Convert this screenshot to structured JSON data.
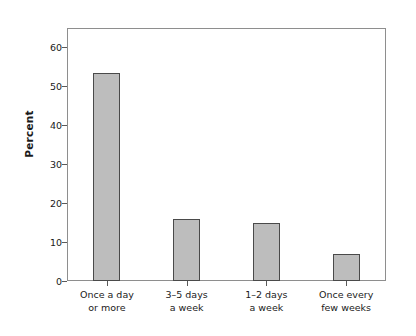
{
  "chart_data": {
    "type": "bar",
    "title": "",
    "subtitle": "",
    "xlabel": "",
    "ylabel": "Percent",
    "categories": [
      "Once a day\nor more",
      "3–5 days\na week",
      "1–2 days\na week",
      "Once every\nfew weeks"
    ],
    "category_lines": [
      [
        "Once a day",
        "or more"
      ],
      [
        "3–5 days",
        "a week"
      ],
      [
        "1–2 days",
        "a week"
      ],
      [
        "Once every",
        "few weeks"
      ]
    ],
    "values": [
      53.5,
      16,
      15,
      7
    ],
    "ylim": [
      0,
      65
    ],
    "yticks": [
      0,
      10,
      20,
      30,
      40,
      50,
      60
    ],
    "ytick_labels": [
      "0",
      "10",
      "20",
      "30",
      "40",
      "50",
      "60"
    ],
    "grid": false,
    "legend": null,
    "legend_position": "none",
    "bar_fill_color": "#bdbdbd",
    "bar_edge_color": "#4a4a4a",
    "axis_color": "#8e8e8e",
    "text_color": "#1a1a1a",
    "background_color": "#ffffff"
  }
}
